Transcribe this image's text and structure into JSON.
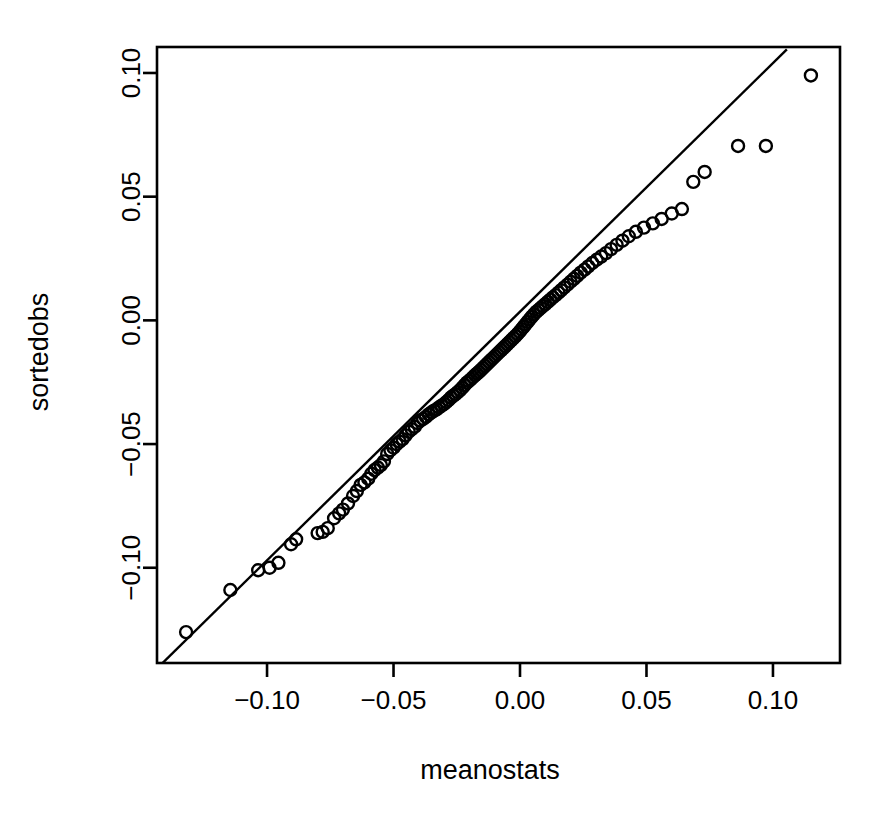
{
  "chart_data": {
    "type": "scatter",
    "title": "",
    "subtitle": "",
    "xlabel": "meanostats",
    "ylabel": "sortedobs",
    "xlim": [
      -0.1435,
      0.1265
    ],
    "ylim": [
      -0.1385,
      0.1105
    ],
    "xticks": [
      -0.1,
      -0.05,
      0.0,
      0.05,
      0.1
    ],
    "xtick_labels": [
      "-0.10",
      "-0.05",
      "0.00",
      "0.05",
      "0.10"
    ],
    "yticks": [
      -0.1,
      -0.05,
      0.0,
      0.05,
      0.1
    ],
    "ytick_labels": [
      "-0.10",
      "-0.05",
      "0.00",
      "0.05",
      "0.10"
    ],
    "grid": false,
    "legend": null,
    "legend_position": "none",
    "marker": "open-circle",
    "marker_size": 12,
    "marker_color": "#000000",
    "marker_fill": "none",
    "reference_line": {
      "type": "qq-line",
      "slope": 1.005,
      "intercept": 0.0035,
      "color": "#000000",
      "width": 2,
      "x_start": -0.1435,
      "x_end": 0.1055
    },
    "annotations": [],
    "x": [
      -0.132,
      -0.1145,
      -0.1035,
      -0.099,
      -0.0955,
      -0.0905,
      -0.0885,
      -0.08,
      -0.078,
      -0.076,
      -0.0735,
      -0.0715,
      -0.07,
      -0.068,
      -0.066,
      -0.0645,
      -0.063,
      -0.0615,
      -0.06,
      -0.0588,
      -0.0575,
      -0.0562,
      -0.055,
      -0.0538,
      -0.0525,
      -0.0512,
      -0.05,
      -0.0488,
      -0.0476,
      -0.0464,
      -0.0452,
      -0.044,
      -0.0428,
      -0.0416,
      -0.0405,
      -0.0394,
      -0.0383,
      -0.0372,
      -0.0361,
      -0.035,
      -0.034,
      -0.033,
      -0.032,
      -0.031,
      -0.03,
      -0.0291,
      -0.0282,
      -0.0273,
      -0.0264,
      -0.0255,
      -0.0246,
      -0.0237,
      -0.0228,
      -0.0219,
      -0.021,
      -0.0202,
      -0.0194,
      -0.0186,
      -0.0178,
      -0.017,
      -0.0162,
      -0.0154,
      -0.0146,
      -0.0138,
      -0.013,
      -0.0122,
      -0.0114,
      -0.0106,
      -0.0098,
      -0.009,
      -0.0082,
      -0.0074,
      -0.0066,
      -0.0058,
      -0.005,
      -0.0042,
      -0.0034,
      -0.0026,
      -0.0018,
      -0.001,
      -0.0002,
      0.0006,
      0.0014,
      0.0022,
      0.003,
      0.0038,
      0.0046,
      0.0055,
      0.0064,
      0.0073,
      0.0082,
      0.0091,
      0.01,
      0.011,
      0.012,
      0.013,
      0.0141,
      0.0152,
      0.0163,
      0.0175,
      0.0187,
      0.02,
      0.0213,
      0.0226,
      0.024,
      0.0255,
      0.027,
      0.0286,
      0.0303,
      0.0321,
      0.034,
      0.036,
      0.0382,
      0.0405,
      0.043,
      0.0458,
      0.049,
      0.0525,
      0.056,
      0.06,
      0.064,
      0.0685,
      0.073,
      0.0862,
      0.0972,
      0.115
    ],
    "y": [
      -0.126,
      -0.109,
      -0.101,
      -0.1,
      -0.098,
      -0.0905,
      -0.0885,
      -0.086,
      -0.0855,
      -0.084,
      -0.08,
      -0.078,
      -0.0765,
      -0.074,
      -0.071,
      -0.069,
      -0.0665,
      -0.0655,
      -0.064,
      -0.062,
      -0.0605,
      -0.0595,
      -0.0585,
      -0.057,
      -0.054,
      -0.0525,
      -0.0515,
      -0.05,
      -0.049,
      -0.048,
      -0.0465,
      -0.045,
      -0.044,
      -0.043,
      -0.0415,
      -0.0405,
      -0.0398,
      -0.039,
      -0.038,
      -0.0372,
      -0.0365,
      -0.036,
      -0.0352,
      -0.0345,
      -0.0338,
      -0.033,
      -0.0322,
      -0.0312,
      -0.0305,
      -0.0298,
      -0.029,
      -0.0282,
      -0.0272,
      -0.0262,
      -0.0252,
      -0.0245,
      -0.0238,
      -0.023,
      -0.0222,
      -0.0215,
      -0.0208,
      -0.02,
      -0.0192,
      -0.0184,
      -0.0176,
      -0.0168,
      -0.016,
      -0.0152,
      -0.0144,
      -0.0136,
      -0.0128,
      -0.012,
      -0.0112,
      -0.0104,
      -0.0096,
      -0.0088,
      -0.008,
      -0.0072,
      -0.0064,
      -0.0055,
      -0.0046,
      -0.0036,
      -0.0026,
      -0.0016,
      -0.0006,
      0.0004,
      0.0014,
      0.0024,
      0.0034,
      0.0042,
      0.005,
      0.0058,
      0.0066,
      0.0075,
      0.0084,
      0.0093,
      0.0102,
      0.0112,
      0.0122,
      0.0133,
      0.0144,
      0.0156,
      0.0168,
      0.018,
      0.0193,
      0.0205,
      0.0218,
      0.0232,
      0.0245,
      0.0258,
      0.0272,
      0.0288,
      0.0305,
      0.0322,
      0.034,
      0.0358,
      0.0375,
      0.0392,
      0.041,
      0.0432,
      0.045,
      0.056,
      0.06,
      0.0705,
      0.0705,
      0.099
    ]
  }
}
